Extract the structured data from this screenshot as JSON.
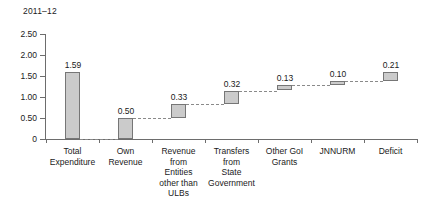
{
  "chart_data": {
    "type": "bar",
    "subtype": "waterfall",
    "title": "2011–12",
    "xlabel": "",
    "ylabel": "",
    "ylim": [
      0,
      2.5
    ],
    "ytick_labels": [
      "2.50",
      "2.00",
      "1.50",
      "1.00",
      "0.50",
      "0"
    ],
    "ytick_values": [
      2.5,
      2.0,
      1.5,
      1.0,
      0.5,
      0
    ],
    "grid": false,
    "legend": null,
    "categories": [
      "Total\nExpenditure",
      "Own\nRevenue",
      "Revenue\nfrom\nEntities\nother than\nULBs",
      "Transfers\nfrom\nState\nGovernment",
      "Other GoI\nGrants",
      "JNNURM",
      "Deficit"
    ],
    "values": [
      1.59,
      0.5,
      0.33,
      0.32,
      0.13,
      0.1,
      0.21
    ],
    "value_labels": [
      "1.59",
      "0.50",
      "0.33",
      "0.32",
      "0.13",
      "0.10",
      "0.21"
    ],
    "bar_bases": [
      0,
      0,
      0.5,
      0.83,
      1.15,
      1.28,
      1.38
    ],
    "bar_tops": [
      1.59,
      0.5,
      0.83,
      1.15,
      1.28,
      1.38,
      1.59
    ],
    "bar_fill_color": "#cbcbcb",
    "bar_border_color": "#767676",
    "connector_color": "#8a8a8a",
    "axis_color": "#6d6d6d",
    "background_color": "#ffffff"
  },
  "axis": {
    "y_labels": [
      {
        "text": "2.50"
      },
      {
        "text": "2.00"
      },
      {
        "text": "1.50"
      },
      {
        "text": "1.00"
      },
      {
        "text": "0.50"
      },
      {
        "text": "0"
      }
    ]
  },
  "categories": [
    {
      "lines": [
        "Total",
        "Expenditure"
      ]
    },
    {
      "lines": [
        "Own",
        "Revenue"
      ]
    },
    {
      "lines": [
        "Revenue",
        "from",
        "Entities",
        "other than",
        "ULBs"
      ]
    },
    {
      "lines": [
        "Transfers",
        "from",
        "State",
        "Government"
      ]
    },
    {
      "lines": [
        "Other GoI",
        "Grants"
      ]
    },
    {
      "lines": [
        "JNNURM"
      ]
    },
    {
      "lines": [
        "Deficit"
      ]
    }
  ]
}
